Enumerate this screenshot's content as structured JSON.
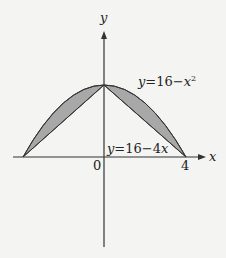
{
  "diagram": {
    "axes": {
      "x_label": "x",
      "y_label": "y",
      "origin_label": "0",
      "x_tick_label": "4"
    },
    "curves": {
      "parabola_label": "y=16−x²",
      "parabola_label_parts": {
        "lhs": "y",
        "eq": "=16−",
        "var": "x",
        "exp": "2"
      },
      "line_label_parts": {
        "lhs": "y",
        "eq": "=16−4",
        "var": "x"
      },
      "line_label": "y=16−4x"
    },
    "colors": {
      "background": "#f4f4f2",
      "shaded_region": "#a8a8a8",
      "stroke": "#333333"
    }
  }
}
